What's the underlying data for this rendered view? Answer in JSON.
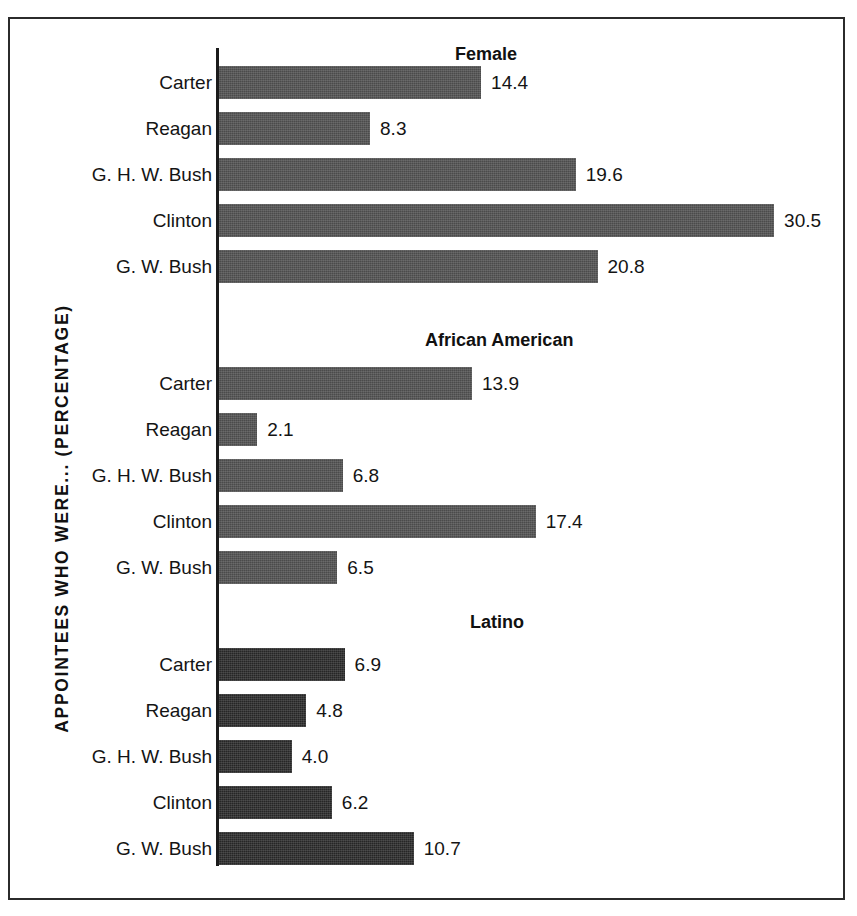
{
  "figure": {
    "ylabel": "APPOINTEES WHO WERE... (PERCENTAGE)"
  },
  "chart_data": {
    "type": "bar",
    "orientation": "horizontal",
    "title": "",
    "xlabel": "",
    "ylabel": "APPOINTEES WHO WERE... (PERCENTAGE)",
    "categories": [
      "Carter",
      "Reagan",
      "G. H. W. Bush",
      "Clinton",
      "G. W. Bush"
    ],
    "panels": [
      {
        "title": "Female",
        "categories": [
          "Carter",
          "Reagan",
          "G. H. W. Bush",
          "Clinton",
          "G. W. Bush"
        ],
        "values": [
          14.4,
          8.3,
          19.6,
          30.5,
          20.8
        ],
        "value_labels": [
          "14.4",
          "8.3",
          "19.6",
          "30.5",
          "20.8"
        ],
        "bar_color": "#4b4b4b"
      },
      {
        "title": "African American",
        "categories": [
          "Carter",
          "Reagan",
          "G. H. W. Bush",
          "Clinton",
          "G. W. Bush"
        ],
        "values": [
          13.9,
          2.1,
          6.8,
          17.4,
          6.5
        ],
        "value_labels": [
          "13.9",
          "2.1",
          "6.8",
          "17.4",
          "6.5"
        ],
        "bar_color": "#4b4b4b"
      },
      {
        "title": "Latino",
        "categories": [
          "Carter",
          "Reagan",
          "G. H. W. Bush",
          "Clinton",
          "G. W. Bush"
        ],
        "values": [
          6.9,
          4.8,
          4.0,
          6.2,
          10.7
        ],
        "value_labels": [
          "6.9",
          "4.8",
          "4.0",
          "6.2",
          "10.7"
        ],
        "bar_color": "#262626"
      }
    ],
    "xlim": [
      0,
      31
    ],
    "grid": false,
    "legend": false,
    "axis_line": "vertical-left"
  }
}
